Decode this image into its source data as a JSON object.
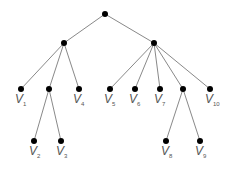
{
  "diagram": {
    "type": "rooted-tree",
    "nodes": [
      {
        "id": "r",
        "x": 105,
        "y": 14,
        "label": ""
      },
      {
        "id": "a",
        "x": 64,
        "y": 43,
        "label": ""
      },
      {
        "id": "b",
        "x": 154,
        "y": 43,
        "label": ""
      },
      {
        "id": "v1",
        "x": 21,
        "y": 89,
        "label": "v",
        "sub": "1"
      },
      {
        "id": "c",
        "x": 49,
        "y": 89,
        "label": ""
      },
      {
        "id": "v4",
        "x": 79,
        "y": 89,
        "label": "v",
        "sub": "4"
      },
      {
        "id": "v5",
        "x": 110,
        "y": 89,
        "label": "v",
        "sub": "5"
      },
      {
        "id": "v6",
        "x": 135,
        "y": 89,
        "label": "v",
        "sub": "6"
      },
      {
        "id": "v7",
        "x": 160,
        "y": 89,
        "label": "v",
        "sub": "7"
      },
      {
        "id": "d",
        "x": 183,
        "y": 89,
        "label": ""
      },
      {
        "id": "v10",
        "x": 210,
        "y": 89,
        "label": "v",
        "sub": "10"
      },
      {
        "id": "v2",
        "x": 34,
        "y": 141,
        "label": "v",
        "sub": "2"
      },
      {
        "id": "v3",
        "x": 61,
        "y": 141,
        "label": "v",
        "sub": "3"
      },
      {
        "id": "v8",
        "x": 166,
        "y": 141,
        "label": "v",
        "sub": "8"
      },
      {
        "id": "v9",
        "x": 200,
        "y": 141,
        "label": "v",
        "sub": "9"
      }
    ],
    "edges": [
      [
        "r",
        "a"
      ],
      [
        "r",
        "b"
      ],
      [
        "a",
        "v1"
      ],
      [
        "a",
        "c"
      ],
      [
        "a",
        "v4"
      ],
      [
        "b",
        "v5"
      ],
      [
        "b",
        "v6"
      ],
      [
        "b",
        "v7"
      ],
      [
        "b",
        "d"
      ],
      [
        "b",
        "v10"
      ],
      [
        "c",
        "v2"
      ],
      [
        "c",
        "v3"
      ],
      [
        "d",
        "v8"
      ],
      [
        "d",
        "v9"
      ]
    ]
  },
  "labels": {
    "v1": {
      "main": "V",
      "sub": "1"
    },
    "v2": {
      "main": "V",
      "sub": "2"
    },
    "v3": {
      "main": "V",
      "sub": "3"
    },
    "v4": {
      "main": "V",
      "sub": "4"
    },
    "v5": {
      "main": "V",
      "sub": "5"
    },
    "v6": {
      "main": "V",
      "sub": "6"
    },
    "v7": {
      "main": "V",
      "sub": "7"
    },
    "v8": {
      "main": "V",
      "sub": "8"
    },
    "v9": {
      "main": "V",
      "sub": "9"
    },
    "v10": {
      "main": "V",
      "sub": "10"
    }
  },
  "colors": {
    "edge": "#7a7a7a",
    "node": "#000000",
    "label": "#555555"
  }
}
